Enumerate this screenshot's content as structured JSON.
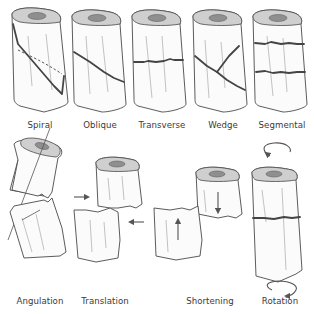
{
  "diagram": {
    "top_row": [
      {
        "id": "spiral",
        "label": "Spiral"
      },
      {
        "id": "oblique",
        "label": "Oblique"
      },
      {
        "id": "transverse",
        "label": "Transverse"
      },
      {
        "id": "wedge",
        "label": "Wedge"
      },
      {
        "id": "segmental",
        "label": "Segmental"
      }
    ],
    "bottom_row": [
      {
        "id": "angulation",
        "label": "Angulation"
      },
      {
        "id": "translation",
        "label": "Translation"
      },
      {
        "id": "shortening",
        "label": "Shortening"
      },
      {
        "id": "rotation",
        "label": "Rotation"
      }
    ],
    "colors": {
      "outline": "#4a4a4a",
      "bone_fill": "#fbfbfb",
      "cortex_top": "#cfcfcf",
      "marrow": "#8f8f8f",
      "fracture_line": "#444444"
    }
  }
}
